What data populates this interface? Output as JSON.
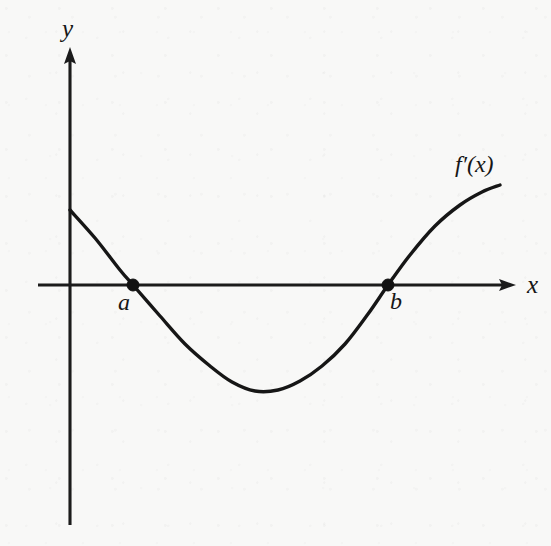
{
  "figure": {
    "kind": "line",
    "background_color": "#f8f8f7",
    "ink_color": "#161616",
    "axis_labels": {
      "y": "y",
      "x": "x"
    },
    "curve_label": "f′(x)",
    "point_labels": {
      "a": "a",
      "b": "b"
    }
  },
  "chart_data": {
    "type": "line",
    "title": "",
    "subtitle": "",
    "xlabel": "x",
    "ylabel": "y",
    "grid": false,
    "legend": null,
    "axes": {
      "x_axis": {
        "pixel_y": 285,
        "pixel_x_start": 38,
        "pixel_x_end": 516,
        "arrow": "right",
        "ticks": [],
        "tick_labels": []
      },
      "y_axis": {
        "pixel_x": 70,
        "pixel_y_start": 47,
        "pixel_y_end": 525,
        "arrow": "up",
        "ticks": [],
        "tick_labels": []
      },
      "origin_pixel": [
        70,
        285
      ],
      "xlim": [
        38,
        516
      ],
      "ylim": [
        525,
        47
      ]
    },
    "series": [
      {
        "name": "f′(x)",
        "label_text": "f′(x)",
        "label_pixel": [
          465,
          166
        ],
        "stroke": "#161616",
        "points_pixel": [
          [
            70,
            210
          ],
          [
            95,
            238
          ],
          [
            120,
            270
          ],
          [
            133,
            285
          ],
          [
            160,
            316
          ],
          [
            185,
            344
          ],
          [
            210,
            366
          ],
          [
            232,
            382
          ],
          [
            255,
            391
          ],
          [
            278,
            390
          ],
          [
            300,
            381
          ],
          [
            322,
            366
          ],
          [
            345,
            344
          ],
          [
            368,
            314
          ],
          [
            388,
            285
          ],
          [
            410,
            255
          ],
          [
            435,
            226
          ],
          [
            460,
            205
          ],
          [
            482,
            192
          ],
          [
            500,
            185
          ]
        ],
        "description": "Curve starts on the positive y-axis, decreases crossing the x-axis at a, reaches a minimum below the axis, then increases crossing the x-axis at b and continues rising."
      }
    ],
    "annotations": [
      {
        "name": "root-a",
        "label": "a",
        "marker": "filled-dot",
        "pixel": [
          133,
          285
        ],
        "label_pixel": [
          126,
          301
        ],
        "meaning": "x-intercept of f′(x); sign change from positive to negative"
      },
      {
        "name": "root-b",
        "label": "b",
        "marker": "filled-dot",
        "pixel": [
          388,
          285
        ],
        "label_pixel": [
          396,
          300
        ],
        "meaning": "x-intercept of f′(x); sign change from negative to positive"
      }
    ]
  }
}
